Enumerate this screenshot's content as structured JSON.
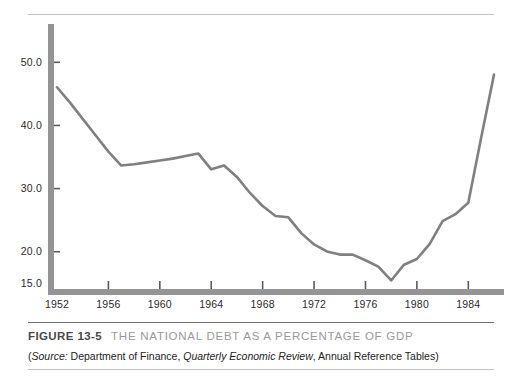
{
  "figure": {
    "number_label": "FIGURE 13-5",
    "title": "THE NATIONAL DEBT AS A PERCENTAGE OF GDP",
    "source_prefix": "(",
    "source_label": "Source:",
    "source_text_1": " Department of Finance, ",
    "source_italic_1": "Quarterly Economic Review",
    "source_text_2": ", Annual Reference Tables)"
  },
  "colors": {
    "line": "#808080",
    "axis": "#949494",
    "tick": "#5c5c5c",
    "rule_light": "#c2c2c2",
    "rule_dark": "#6f6f6f",
    "label": "#2b2b2b",
    "title_gray": "#9a9a9a",
    "background": "#ffffff"
  },
  "chart_data": {
    "type": "line",
    "title": "THE NATIONAL DEBT AS A PERCENTAGE OF GDP",
    "xlabel": "",
    "ylabel": "",
    "grid": false,
    "legend": "none",
    "xlim": [
      1951,
      1986
    ],
    "ylim": [
      13.5,
      55.5
    ],
    "yticks": [
      15.0,
      20.0,
      30.0,
      40.0,
      50.0
    ],
    "ytick_labels": [
      "15.0",
      "20.0",
      "30.0",
      "40.0",
      "50.0"
    ],
    "xticks": [
      1952,
      1956,
      1960,
      1964,
      1968,
      1972,
      1976,
      1980,
      1984
    ],
    "xtick_labels": [
      "1952",
      "1956",
      "1960",
      "1964",
      "1968",
      "1972",
      "1976",
      "1980",
      "1984"
    ],
    "series": [
      {
        "name": "National debt as % of GDP",
        "x": [
          1952,
          1953,
          1954,
          1955,
          1956,
          1957,
          1958,
          1959,
          1960,
          1961,
          1962,
          1963,
          1964,
          1965,
          1966,
          1967,
          1968,
          1969,
          1970,
          1971,
          1972,
          1973,
          1974,
          1975,
          1976,
          1977,
          1978,
          1979,
          1980,
          1981,
          1982,
          1983,
          1984,
          1985,
          1986
        ],
        "values": [
          46.0,
          43.6,
          41.0,
          38.4,
          35.8,
          33.6,
          33.8,
          34.1,
          34.4,
          34.7,
          35.1,
          35.5,
          33.0,
          33.6,
          31.8,
          29.3,
          27.2,
          25.6,
          25.4,
          22.9,
          21.1,
          20.0,
          19.5,
          19.5,
          18.6,
          17.6,
          15.4,
          17.9,
          18.8,
          21.2,
          24.8,
          25.9,
          27.7,
          38.0,
          48.0
        ]
      }
    ]
  }
}
